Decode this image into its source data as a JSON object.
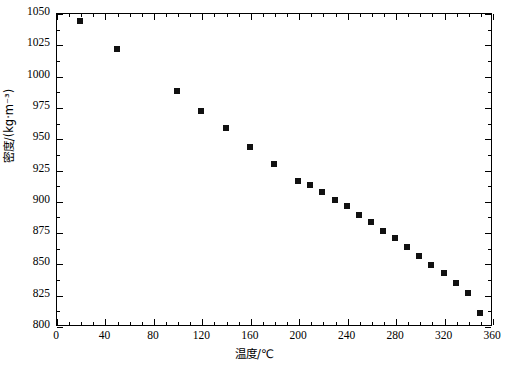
{
  "chart_data": {
    "type": "scatter",
    "title": "",
    "xlabel": "温度/℃",
    "ylabel": "密度/(kg·m⁻³)",
    "xlim": [
      0,
      360
    ],
    "ylim": [
      800,
      1050
    ],
    "xticks": [
      0,
      40,
      80,
      120,
      160,
      200,
      240,
      280,
      320,
      360
    ],
    "yticks": [
      800,
      825,
      850,
      875,
      900,
      925,
      950,
      975,
      1000,
      1025,
      1050
    ],
    "x_minor_interval": 10,
    "y_minor_interval": 12.5,
    "grid": false,
    "legend": null,
    "marker": "square",
    "marker_color": "#111111",
    "series": [
      {
        "name": "密度",
        "x": [
          20,
          50,
          100,
          120,
          140,
          160,
          180,
          200,
          210,
          220,
          230,
          240,
          250,
          260,
          270,
          280,
          290,
          300,
          310,
          320,
          330,
          340,
          350
        ],
        "values": [
          1044,
          1021,
          988,
          972,
          958,
          943,
          929,
          916,
          913,
          907,
          901,
          896,
          889,
          883,
          876,
          870,
          863,
          856,
          849,
          842,
          834,
          826,
          810
        ]
      }
    ]
  },
  "axes": {
    "x_tick_labels": [
      "0",
      "40",
      "80",
      "120",
      "160",
      "200",
      "240",
      "280",
      "320",
      "360"
    ],
    "y_tick_labels": [
      "800",
      "825",
      "850",
      "875",
      "900",
      "925",
      "950",
      "975",
      "1000",
      "1025",
      "1050"
    ],
    "x_title": "温度/℃",
    "y_title": "密度/(kg·m⁻³)"
  }
}
